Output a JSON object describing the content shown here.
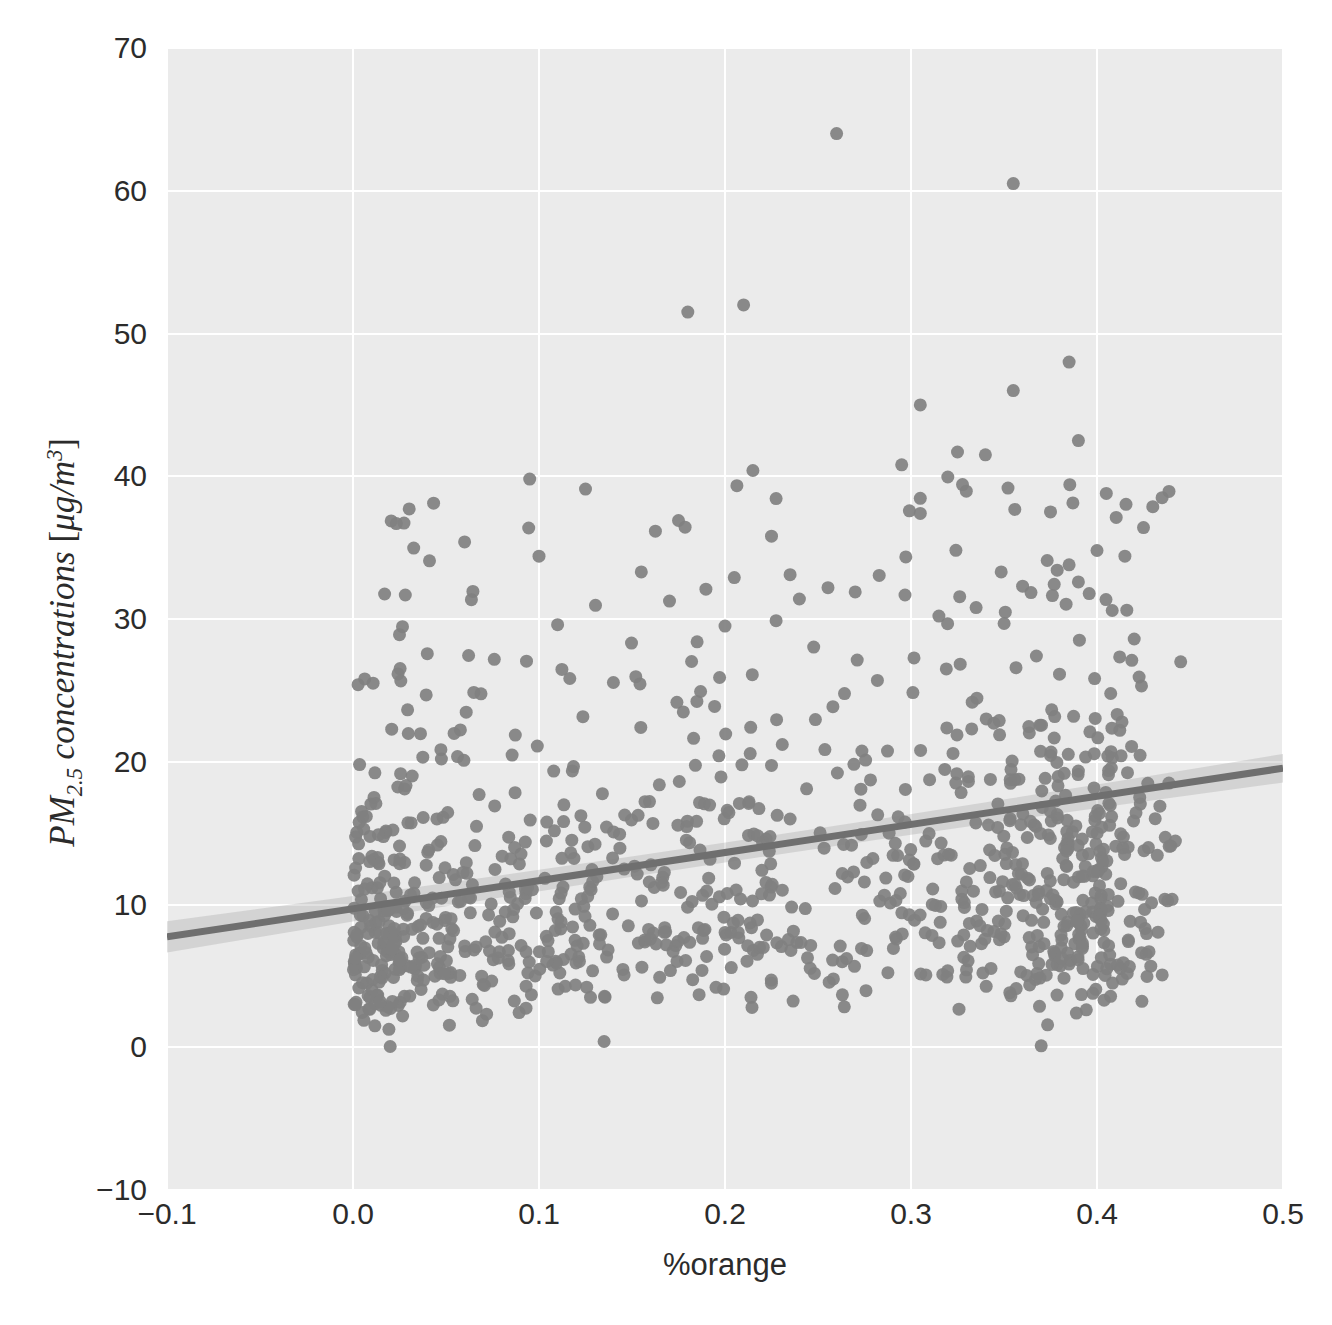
{
  "chart_data": {
    "type": "scatter",
    "title": "",
    "subtitle": "",
    "xlabel": "%orange",
    "ylabel": "PM_{2.5} concentrations [μg/m^3]",
    "ylabel_parts": {
      "prefix": "PM",
      "subscript": "2.5",
      "middle": " concentrations [",
      "unit_numer": "μg/m",
      "unit_exp": "3",
      "suffix": "]"
    },
    "xlim": [
      -0.1,
      0.5
    ],
    "ylim": [
      -10,
      70
    ],
    "xticks": [
      "−0.1",
      "0.0",
      "0.1",
      "0.2",
      "0.3",
      "0.4",
      "0.5"
    ],
    "xtick_values": [
      -0.1,
      0.0,
      0.1,
      0.2,
      0.3,
      0.4,
      0.5
    ],
    "yticks": [
      "70",
      "60",
      "50",
      "40",
      "30",
      "20",
      "10",
      "0",
      "−10"
    ],
    "ytick_values": [
      70,
      60,
      50,
      40,
      30,
      20,
      10,
      0,
      -10
    ],
    "grid": true,
    "legend": "none",
    "style": "seaborn-darkgrid",
    "colors": {
      "axes_background": "#ebebeb",
      "grid": "#ffffff",
      "marker": "#808080",
      "regression_line": "#6f6f6f",
      "confidence_band": "#9a9a9a",
      "text": "#2b2b2b",
      "figure_background": "#ffffff"
    },
    "marker": {
      "shape": "circle",
      "size_px": 13,
      "opacity": 0.92
    },
    "regression": {
      "shown": true,
      "slope": 19.7,
      "intercept": 9.7,
      "x_start": -0.1,
      "x_end": 0.5,
      "y_start": 7.73,
      "y_end": 19.55,
      "ci": 95,
      "ci_half_width_start": 1.1,
      "ci_half_width_mid": 0.35,
      "ci_half_width_end": 1.0
    },
    "n_points": 1015,
    "x_data_range": [
      0.0,
      0.44
    ],
    "y_data_range": [
      0.0,
      64.0
    ],
    "notable_points": [
      {
        "x": 0.26,
        "y": 64.0
      },
      {
        "x": 0.355,
        "y": 60.5
      },
      {
        "x": 0.21,
        "y": 52.0
      },
      {
        "x": 0.18,
        "y": 51.5
      },
      {
        "x": 0.385,
        "y": 48.0
      },
      {
        "x": 0.355,
        "y": 46.0
      },
      {
        "x": 0.305,
        "y": 45.0
      },
      {
        "x": 0.39,
        "y": 42.5
      },
      {
        "x": 0.325,
        "y": 41.7
      },
      {
        "x": 0.34,
        "y": 41.5
      },
      {
        "x": 0.295,
        "y": 40.8
      },
      {
        "x": 0.215,
        "y": 40.4
      },
      {
        "x": 0.095,
        "y": 39.8
      },
      {
        "x": 0.125,
        "y": 39.1
      },
      {
        "x": 0.405,
        "y": 38.8
      },
      {
        "x": 0.435,
        "y": 38.5
      },
      {
        "x": 0.375,
        "y": 37.5
      },
      {
        "x": 0.305,
        "y": 37.4
      },
      {
        "x": 0.175,
        "y": 36.9
      },
      {
        "x": 0.425,
        "y": 36.4
      },
      {
        "x": 0.225,
        "y": 35.8
      },
      {
        "x": 0.06,
        "y": 35.4
      },
      {
        "x": 0.4,
        "y": 34.8
      },
      {
        "x": 0.415,
        "y": 34.4
      },
      {
        "x": 0.1,
        "y": 34.4
      },
      {
        "x": 0.385,
        "y": 33.8
      },
      {
        "x": 0.155,
        "y": 33.3
      },
      {
        "x": 0.235,
        "y": 33.1
      },
      {
        "x": 0.205,
        "y": 32.9
      },
      {
        "x": 0.39,
        "y": 32.6
      },
      {
        "x": 0.36,
        "y": 32.3
      },
      {
        "x": 0.27,
        "y": 31.9
      },
      {
        "x": 0.24,
        "y": 31.4
      },
      {
        "x": 0.335,
        "y": 30.8
      },
      {
        "x": 0.315,
        "y": 30.2
      },
      {
        "x": 0.11,
        "y": 29.6
      },
      {
        "x": 0.2,
        "y": 29.5
      },
      {
        "x": 0.025,
        "y": 28.9
      },
      {
        "x": 0.42,
        "y": 28.6
      },
      {
        "x": 0.185,
        "y": 28.4
      },
      {
        "x": 0.445,
        "y": 27.0
      },
      {
        "x": 0.37,
        "y": 0.1
      },
      {
        "x": 0.02,
        "y": 0.05
      },
      {
        "x": 0.135,
        "y": 0.4
      }
    ]
  }
}
